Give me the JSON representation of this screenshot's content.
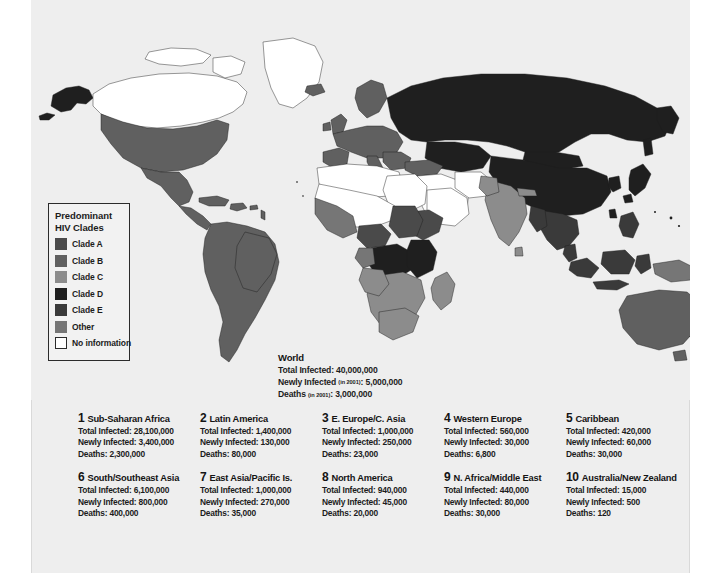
{
  "legend": {
    "title_line1": "Predominant",
    "title_line2": "HIV Clades",
    "items": [
      {
        "label": "Clade A",
        "color": "#4a4a4a",
        "swatch": "clade-a-swatch"
      },
      {
        "label": "Clade B",
        "color": "#606060",
        "swatch": "clade-b-swatch"
      },
      {
        "label": "Clade C",
        "color": "#8c8c8c",
        "swatch": "clade-c-swatch"
      },
      {
        "label": "Clade D",
        "color": "#1f1f1f",
        "swatch": "clade-d-swatch"
      },
      {
        "label": "Clade E",
        "color": "#3a3a3a",
        "swatch": "clade-e-swatch"
      },
      {
        "label": "Other",
        "color": "#767676",
        "swatch": "other-swatch"
      },
      {
        "label": "No information",
        "color": "#ffffff",
        "swatch": "no-information-swatch"
      }
    ]
  },
  "world": {
    "title": "World",
    "total_infected_label": "Total Infected: ",
    "total_infected_value": "40,000,000",
    "newly_infected_label": "Newly Infected ",
    "newly_infected_note": "(in 2001)",
    "newly_infected_sep": ": ",
    "newly_infected_value": "5,000,000",
    "deaths_label": "Deaths ",
    "deaths_note": "(in 2001)",
    "deaths_sep": ": ",
    "deaths_value": "3,000,000"
  },
  "regions": [
    {
      "num": "1",
      "name": "Sub-Saharan Africa",
      "total": "Total Infected: 28,100,000",
      "newly": "Newly Infected: 3,400,000",
      "deaths": "Deaths: 2,300,000"
    },
    {
      "num": "2",
      "name": "Latin America",
      "total": "Total Infected: 1,400,000",
      "newly": "Newly Infected: 130,000",
      "deaths": "Deaths: 80,000"
    },
    {
      "num": "3",
      "name": "E. Europe/C. Asia",
      "total": "Total Infected: 1,000,000",
      "newly": "Newly Infected: 250,000",
      "deaths": "Deaths: 23,000"
    },
    {
      "num": "4",
      "name": "Western Europe",
      "total": "Total Infected: 560,000",
      "newly": "Newly Infected: 30,000",
      "deaths": "Deaths: 6,800"
    },
    {
      "num": "5",
      "name": "Caribbean",
      "total": "Total Infected: 420,000",
      "newly": "Newly Infected: 60,000",
      "deaths": "Deaths: 30,000"
    },
    {
      "num": "6",
      "name": "South/Southeast Asia",
      "total": "Total Infected: 6,100,000",
      "newly": "Newly Infected: 800,000",
      "deaths": "Deaths: 400,000"
    },
    {
      "num": "7",
      "name": "East Asia/Pacific Is.",
      "total": "Total Infected: 1,000,000",
      "newly": "Newly Infected: 270,000",
      "deaths": "Deaths: 35,000"
    },
    {
      "num": "8",
      "name": "North America",
      "total": "Total Infected: 940,000",
      "newly": "Newly Infected: 45,000",
      "deaths": "Deaths: 20,000"
    },
    {
      "num": "9",
      "name": "N. Africa/Middle East",
      "total": "Total Infected: 440,000",
      "newly": "Newly Infected: 80,000",
      "deaths": "Deaths: 30,000"
    },
    {
      "num": "10",
      "name": "Australia/New Zealand",
      "total": "Total Infected: 15,000",
      "newly": "Newly Infected: 500",
      "deaths": "Deaths: 120"
    }
  ],
  "map": {
    "background": "#eeeeee",
    "ocean": "#eeeeee",
    "outline": "#1c1c1c",
    "fills": {
      "clade_a": "#4a4a4a",
      "clade_b": "#606060",
      "clade_c": "#8c8c8c",
      "clade_d": "#1f1f1f",
      "clade_e": "#3a3a3a",
      "other": "#767676",
      "no_information": "#ffffff"
    }
  }
}
